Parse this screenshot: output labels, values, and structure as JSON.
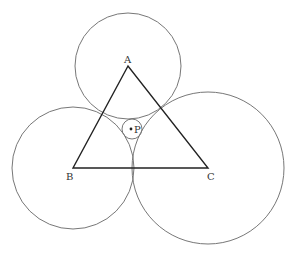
{
  "diagram": {
    "type": "triangle with tangent circles",
    "points": {
      "A": {
        "label": "A",
        "x": 128,
        "y": 66
      },
      "B": {
        "label": "B",
        "x": 73,
        "y": 168
      },
      "C": {
        "label": "C",
        "x": 208,
        "y": 168
      },
      "P": {
        "label": "P",
        "x": 132,
        "y": 129
      }
    },
    "circles": [
      {
        "name": "circle-A",
        "cx": 128,
        "cy": 66,
        "r": 53
      },
      {
        "name": "circle-B",
        "cx": 73,
        "cy": 168,
        "r": 61
      },
      {
        "name": "circle-C",
        "cx": 208,
        "cy": 168,
        "r": 76
      },
      {
        "name": "circle-P",
        "cx": 132,
        "cy": 129,
        "r": 10
      }
    ],
    "colors": {
      "triangle": "#222222",
      "circle": "#777777",
      "text": "#333333"
    }
  }
}
